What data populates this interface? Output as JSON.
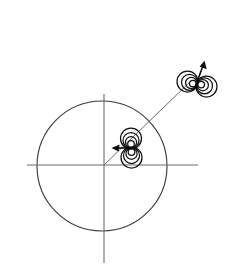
{
  "figure": {
    "background_color": "#ffffff",
    "width": 241,
    "height": 280,
    "caption": "",
    "colors": {
      "axis": "#6b6b6b",
      "circle": "#3c3c3c",
      "ray": "#6f6f6f",
      "lobe": "#121212",
      "arrow": "#0c0c0c"
    }
  },
  "axes": {
    "label_x": "",
    "label_y": "",
    "origin": {
      "x": 104,
      "y": 165
    },
    "horizontal": {
      "x1": 27,
      "y1": 165,
      "x2": 198,
      "y2": 165
    },
    "vertical": {
      "x1": 104,
      "y1": 94,
      "x2": 104,
      "y2": 263
    },
    "tick_labels": []
  },
  "circle": {
    "name": "unit-circle",
    "center_x": 102,
    "center_y": 166,
    "radius": 65
  },
  "ray": {
    "name": "radial-ray",
    "x1": 104,
    "y1": 165,
    "x2": 192,
    "y2": 80,
    "angle_deg": 44
  },
  "dipoles": [
    {
      "id": "inner-dipole",
      "label": "",
      "center_x": 131,
      "center_y": 147,
      "orientation": "vertical",
      "lobe_count": 2,
      "arc_count": 4,
      "lobe_radius": 12,
      "arrow": {
        "direction": "left",
        "from_x": 131,
        "from_y": 148,
        "to_x": 112,
        "to_y": 148,
        "angle_deg": 180
      }
    },
    {
      "id": "outer-dipole",
      "label": "",
      "center_x": 196,
      "center_y": 84,
      "orientation": "horizontal",
      "lobe_count": 2,
      "arc_count": 4,
      "lobe_radius": 12,
      "arrow": {
        "direction": "up-right",
        "from_x": 195,
        "from_y": 88,
        "to_x": 205,
        "to_y": 61,
        "angle_deg": 70
      }
    }
  ],
  "chart_data": {
    "type": "scatter",
    "title": "",
    "xlabel": "",
    "ylabel": "",
    "grid": false,
    "legend": null,
    "annotations": [
      "unit circle centered at origin",
      "radial ray from origin at ~44 degrees",
      "inner dipole on ray inside circle, moment arrow pointing left",
      "outer dipole on ray outside circle, moment arrow pointing up-right"
    ],
    "x": [
      0.42,
      1.42
    ],
    "y": [
      0.28,
      1.25
    ],
    "point_labels": [
      "inner-dipole",
      "outer-dipole"
    ]
  }
}
